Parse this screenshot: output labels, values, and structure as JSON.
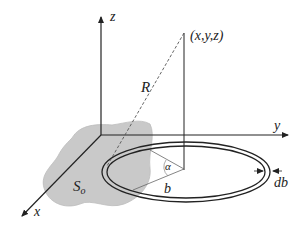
{
  "diagram": {
    "type": "3d-geometry",
    "axes": {
      "x_label": "x",
      "y_label": "y",
      "z_label": "z"
    },
    "point_label": "(x,y,z)",
    "distance_label": "R",
    "region_label": "S",
    "region_subscript": "o",
    "angle_label": "α",
    "radius_label": "b",
    "ring_width_label": "db",
    "colors": {
      "line": "#222222",
      "region_fill": "#c8c8c8",
      "dashed": "#555555"
    }
  }
}
